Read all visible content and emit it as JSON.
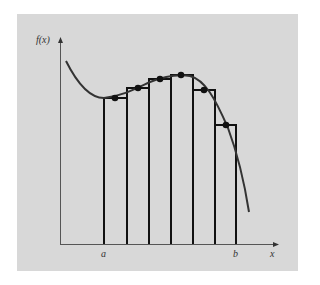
{
  "figure": {
    "background_color": "#d8d8d8",
    "line_color": "#111111",
    "curve_color": "#333333",
    "labels": {
      "y_axis": "f(x)",
      "x_axis": "x",
      "lower_limit": "a",
      "upper_limit": "b"
    },
    "rectangles": [
      {
        "x0": 104,
        "x1": 127,
        "top": 98,
        "mid": [
          115,
          98
        ]
      },
      {
        "x0": 127,
        "x1": 149,
        "top": 88,
        "mid": [
          138,
          88
        ]
      },
      {
        "x0": 149,
        "x1": 171,
        "top": 79,
        "mid": [
          160,
          79
        ]
      },
      {
        "x0": 171,
        "x1": 193,
        "top": 75,
        "mid": [
          181,
          75
        ]
      },
      {
        "x0": 193,
        "x1": 215,
        "top": 90,
        "mid": [
          204,
          90
        ]
      },
      {
        "x0": 215,
        "x1": 236,
        "top": 125,
        "mid": [
          226,
          125
        ]
      }
    ]
  }
}
